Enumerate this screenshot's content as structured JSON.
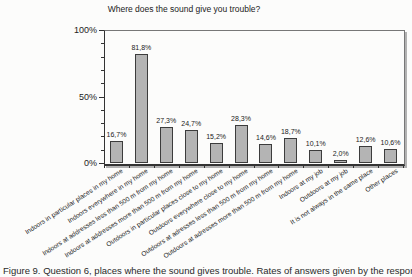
{
  "figure": {
    "title": "Where does the sound give you trouble?",
    "caption": "Figure 9. Question 6, places where the sound gives trouble. Rates of answers given by the respondents"
  },
  "chart_data": {
    "type": "bar",
    "title": "Where does the sound give you trouble?",
    "categories": [
      "Indoors in particular places in my home",
      "Indoors everywhere in my home",
      "Indoors at addresses less than 500 m from my home",
      "Indoors at addresses more than 500 m from my home",
      "Outdoors in particular places close to my home",
      "Outdoors everywhere close to my home",
      "Outdoors at adresses less than 500 m from my home",
      "Outdoors at adresses more than 500 m from my home",
      "Indoors at my job",
      "Outdoors at my job",
      "It is not always in the same place",
      "Other places"
    ],
    "values": [
      16.7,
      81.8,
      27.3,
      24.7,
      15.2,
      28.3,
      14.6,
      18.7,
      10.1,
      2.0,
      12.6,
      10.6
    ],
    "value_labels": [
      "16,7%",
      "81,8%",
      "27,3%",
      "24,7%",
      "15,2%",
      "28,3%",
      "14,6%",
      "18,7%",
      "10,1%",
      "2,0%",
      "12,6%",
      "10,6%"
    ],
    "xlabel": "",
    "ylabel": "",
    "ylim": [
      0,
      100
    ],
    "y_major_ticks": [
      0,
      50,
      100
    ],
    "y_major_tick_labels": [
      "0%",
      "50%",
      "100%"
    ],
    "y_minor_ticks": [
      10,
      20,
      30,
      40,
      60,
      70,
      80,
      90
    ],
    "grid": "off",
    "legend": "none",
    "bar_fill_color": "#b4b4b4",
    "bar_border_color": "#3c3c3c"
  }
}
